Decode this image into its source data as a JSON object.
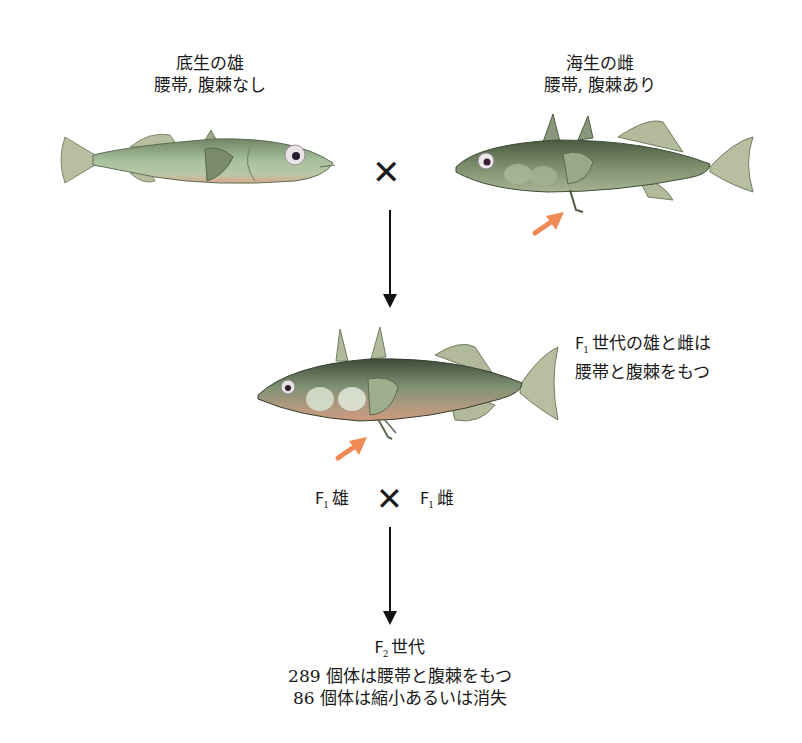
{
  "parents": {
    "male": {
      "title": "底生の雄",
      "description": "腰帯, 腹棘なし",
      "fish": "benthic-stickleback-no-spines"
    },
    "female": {
      "title": "海生の雌",
      "description": "腰帯, 腹棘あり",
      "fish": "marine-stickleback-with-spines"
    },
    "cross_symbol": "✕"
  },
  "f1": {
    "caption_prefix": "F",
    "caption_sub": "1",
    "caption_line1_rest": "世代の雄と雌は",
    "caption_line2": "腰帯と腹棘をもつ",
    "fish": "f1-stickleback-with-spines"
  },
  "f1_cross": {
    "left_prefix": "F",
    "left_sub": "1",
    "left_label": "雄",
    "right_prefix": "F",
    "right_sub": "1",
    "right_label": "雌",
    "cross_symbol": "✕"
  },
  "f2": {
    "title_prefix": "F",
    "title_sub": "2",
    "title_rest": "世代",
    "line1": "289 個体は腰帯と腹棘をもつ",
    "line2": "86 個体は縮小あるいは消失",
    "counts": {
      "with_spines": 289,
      "reduced_or_absent": 86
    }
  },
  "colors": {
    "pointer_arrow": "#f08a55",
    "flow_arrow": "#111111",
    "fish_body": "#8a9a78",
    "fish_fin": "#b8bea0"
  }
}
